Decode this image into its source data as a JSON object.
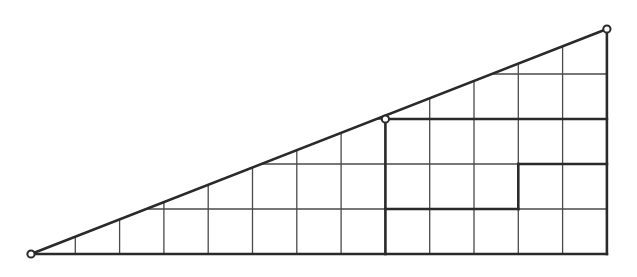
{
  "diagram": {
    "type": "right-triangle-on-grid",
    "colors": {
      "background": "#ffffff",
      "grid": "#4a4a4a",
      "thick": "#2a2a2a"
    },
    "grid": {
      "columns": 13,
      "rows": 5,
      "origin_px": [
        31,
        254
      ],
      "cell_w": 44.3,
      "cell_h": 45
    },
    "triangle": {
      "vertices_grid": [
        [
          0,
          0
        ],
        [
          13,
          0
        ],
        [
          13,
          5
        ]
      ],
      "hypotenuse_grid": [
        [
          0,
          0
        ],
        [
          13,
          5
        ]
      ]
    },
    "marked_points_grid": [
      [
        0,
        0
      ],
      [
        8,
        3
      ],
      [
        13,
        5
      ]
    ],
    "thick_segments_grid": [
      [
        [
          0,
          0
        ],
        [
          13,
          0
        ]
      ],
      [
        [
          13,
          0
        ],
        [
          13,
          5
        ]
      ],
      [
        [
          0,
          0
        ],
        [
          13,
          5
        ]
      ],
      [
        [
          8,
          0
        ],
        [
          8,
          3
        ]
      ],
      [
        [
          8,
          3
        ],
        [
          13,
          3
        ]
      ],
      [
        [
          11,
          2
        ],
        [
          13,
          2
        ]
      ],
      [
        [
          11,
          1
        ],
        [
          11,
          2
        ]
      ],
      [
        [
          8,
          1
        ],
        [
          11,
          1
        ]
      ]
    ]
  }
}
